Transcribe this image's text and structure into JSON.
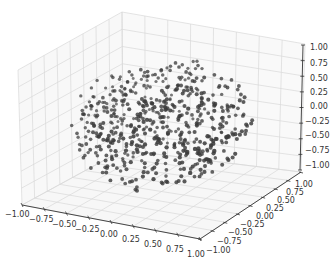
{
  "chart_data": {
    "type": "scatter",
    "projection": "3d",
    "title": "",
    "xlabel": "",
    "ylabel": "",
    "zlabel": "",
    "xlim": [
      -1.0,
      1.0
    ],
    "ylim": [
      -1.0,
      1.0
    ],
    "zlim": [
      -1.0,
      1.0
    ],
    "grid": true,
    "legend": null,
    "x_ticks": [
      "−1.00",
      "−0.75",
      "−0.50",
      "−0.25",
      "0.00",
      "0.25",
      "0.50",
      "0.75",
      "1.00"
    ],
    "y_ticks": [
      "−1.00",
      "−0.75",
      "−0.50",
      "−0.25",
      "0.00",
      "0.25",
      "0.50",
      "0.75",
      "1.00"
    ],
    "z_ticks": [
      "−1.00",
      "−0.75",
      "−0.50",
      "−0.25",
      "0.00",
      "0.25",
      "0.50",
      "0.75",
      "1.00"
    ],
    "series": [
      {
        "name": "points",
        "marker": "o",
        "color": "#3a3a3a",
        "n_points_approx": 600,
        "distribution": "uniform random points inside unit sphere (radius ≈ 0.8–1.0)",
        "sample_points": [
          [
            -0.8,
            -0.3,
            0.1
          ],
          [
            -0.6,
            0.2,
            0.5
          ],
          [
            -0.4,
            -0.6,
            -0.3
          ],
          [
            -0.2,
            0.4,
            0.7
          ],
          [
            0.0,
            0.0,
            0.0
          ],
          [
            0.2,
            -0.5,
            0.4
          ],
          [
            0.4,
            0.6,
            -0.2
          ],
          [
            0.6,
            -0.1,
            -0.6
          ],
          [
            0.8,
            0.3,
            0.2
          ],
          [
            -0.5,
            0.5,
            -0.5
          ],
          [
            0.3,
            0.2,
            0.8
          ],
          [
            -0.1,
            -0.8,
            -0.4
          ],
          [
            0.5,
            -0.6,
            0.1
          ],
          [
            -0.7,
            0.1,
            -0.4
          ],
          [
            0.1,
            0.7,
            0.3
          ],
          [
            -0.3,
            -0.2,
            -0.8
          ]
        ]
      }
    ]
  },
  "axes": {
    "pane_color": "#f2f2f2",
    "grid_color": "#d9d9d9",
    "axis_line_color": "#333333",
    "x_ticks": [
      "−1.00",
      "−0.75",
      "−0.50",
      "−0.25",
      "0.00",
      "0.25",
      "0.50",
      "0.75",
      "1.00"
    ],
    "y_ticks": [
      "−1.00",
      "−0.75",
      "−0.50",
      "−0.25",
      "0.00",
      "0.25",
      "0.50",
      "0.75",
      "1.00"
    ],
    "z_ticks": [
      "−1.00",
      "−0.75",
      "−0.50",
      "−0.25",
      "0.00",
      "0.25",
      "0.50",
      "0.75",
      "1.00"
    ]
  },
  "render": {
    "seed": 12345,
    "n_points": 600,
    "marker_color": "#3c3c3c"
  }
}
